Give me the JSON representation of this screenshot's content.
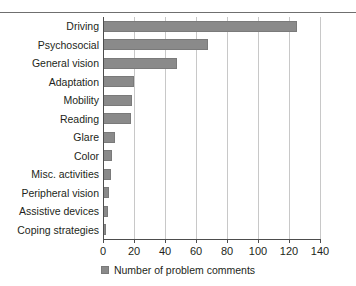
{
  "chart_data": {
    "type": "bar",
    "orientation": "horizontal",
    "title": "",
    "xlabel": "",
    "ylabel": "",
    "xlim": [
      0,
      140
    ],
    "xticks": [
      0,
      20,
      40,
      60,
      80,
      100,
      120,
      140
    ],
    "grid": "vertical",
    "legend_position": "bottom-center",
    "categories": [
      "Driving",
      "Psychosocial",
      "General vision",
      "Adaptation",
      "Mobility",
      "Reading",
      "Glare",
      "Color",
      "Misc. activities",
      "Peripheral vision",
      "Assistive devices",
      "Coping strategies"
    ],
    "values": [
      125,
      68,
      48,
      20,
      19,
      18,
      8,
      6,
      5,
      4,
      3,
      2
    ],
    "series": [
      {
        "name": "Number of problem comments",
        "color": "#8a8a8a",
        "values": [
          125,
          68,
          48,
          20,
          19,
          18,
          8,
          6,
          5,
          4,
          3,
          2
        ]
      }
    ]
  },
  "legend": {
    "swatch_name": "legend-color-swatch",
    "label": "Number of problem comments"
  },
  "colors": {
    "bar": "#8a8a8a",
    "gridline": "#c8c8c8",
    "axis": "#4d4d4d",
    "rule": "#6f6f6f",
    "text": "#231f20",
    "background": "#ffffff"
  }
}
